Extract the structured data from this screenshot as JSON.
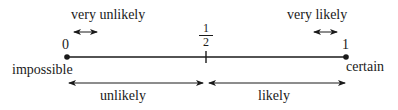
{
  "diagram": {
    "scale": {
      "start_value": "0",
      "end_value": "1",
      "midpoint": {
        "numerator": "1",
        "denominator": "2"
      },
      "start_label": "impossible",
      "end_label": "certain"
    },
    "top_ranges": {
      "left": "very unlikely",
      "right": "very likely"
    },
    "bottom_ranges": {
      "left": "unlikely",
      "right": "likely"
    },
    "colors": {
      "ink": "#1a1a1a",
      "background": "#ffffff"
    }
  }
}
